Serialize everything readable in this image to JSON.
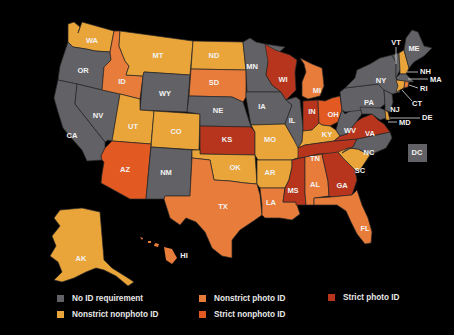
{
  "categories": {
    "none": {
      "label": "No ID requirement",
      "color": "#626266"
    },
    "nonstrict_nonphoto": {
      "label": "Nonstrict nonphoto ID",
      "color": "#e9a43a"
    },
    "nonstrict_photo": {
      "label": "Nonstrict photo ID",
      "color": "#e87c3a"
    },
    "strict_nonphoto": {
      "label": "Strict nonphoto ID",
      "color": "#e25a22"
    },
    "strict_photo": {
      "label": "Strict photo ID",
      "color": "#b6351c"
    }
  },
  "legend": [
    {
      "key": "none",
      "label": "No ID requirement",
      "color": "#626266"
    },
    {
      "key": "nonstrict_nonphoto",
      "label": "Nonstrict nonphoto ID",
      "color": "#e9a43a"
    },
    {
      "key": "nonstrict_photo",
      "label": "Nonstrict photo ID",
      "color": "#e87c3a"
    },
    {
      "key": "strict_nonphoto",
      "label": "Strict nonphoto ID",
      "color": "#e25a22"
    },
    {
      "key": "strict_photo",
      "label": "Strict photo ID",
      "color": "#b6351c"
    }
  ],
  "states": {
    "WA": "nonstrict_nonphoto",
    "OR": "none",
    "CA": "none",
    "NV": "none",
    "ID": "nonstrict_photo",
    "MT": "nonstrict_nonphoto",
    "WY": "none",
    "UT": "nonstrict_nonphoto",
    "CO": "nonstrict_nonphoto",
    "AZ": "strict_nonphoto",
    "NM": "none",
    "ND": "nonstrict_nonphoto",
    "SD": "nonstrict_photo",
    "NE": "none",
    "KS": "strict_photo",
    "OK": "nonstrict_nonphoto",
    "TX": "nonstrict_photo",
    "MN": "none",
    "IA": "none",
    "MO": "nonstrict_nonphoto",
    "AR": "nonstrict_nonphoto",
    "LA": "nonstrict_photo",
    "WI": "strict_photo",
    "IL": "none",
    "MI": "nonstrict_photo",
    "IN": "strict_photo",
    "OH": "strict_nonphoto",
    "KY": "nonstrict_nonphoto",
    "TN": "strict_photo",
    "MS": "strict_photo",
    "AL": "nonstrict_photo",
    "GA": "strict_photo",
    "FL": "nonstrict_photo",
    "SC": "nonstrict_nonphoto",
    "NC": "none",
    "VA": "strict_photo",
    "WV": "none",
    "PA": "none",
    "NY": "none",
    "NJ": "none",
    "DE": "nonstrict_nonphoto",
    "MD": "none",
    "CT": "nonstrict_nonphoto",
    "RI": "nonstrict_photo",
    "MA": "none",
    "VT": "none",
    "NH": "nonstrict_nonphoto",
    "ME": "none",
    "AK": "nonstrict_nonphoto",
    "HI": "nonstrict_photo",
    "DC": "none"
  },
  "labels": {
    "WA": "WA",
    "OR": "OR",
    "CA": "CA",
    "NV": "NV",
    "ID": "ID",
    "MT": "MT",
    "WY": "WY",
    "UT": "UT",
    "CO": "CO",
    "AZ": "AZ",
    "NM": "NM",
    "ND": "ND",
    "SD": "SD",
    "NE": "NE",
    "KS": "KS",
    "OK": "OK",
    "TX": "TX",
    "MN": "MN",
    "IA": "IA",
    "MO": "MO",
    "AR": "AR",
    "LA": "LA",
    "WI": "WI",
    "IL": "IL",
    "MI": "MI",
    "IN": "IN",
    "OH": "OH",
    "KY": "KY",
    "TN": "TN",
    "MS": "MS",
    "AL": "AL",
    "GA": "GA",
    "FL": "FL",
    "SC": "SC",
    "NC": "NC",
    "VA": "VA",
    "WV": "WV",
    "PA": "PA",
    "NY": "NY",
    "NJ": "NJ",
    "DE": "DE",
    "MD": "MD",
    "CT": "CT",
    "RI": "RI",
    "MA": "MA",
    "VT": "VT",
    "NH": "NH",
    "ME": "ME",
    "AK": "AK",
    "HI": "HI",
    "DC": "DC"
  }
}
